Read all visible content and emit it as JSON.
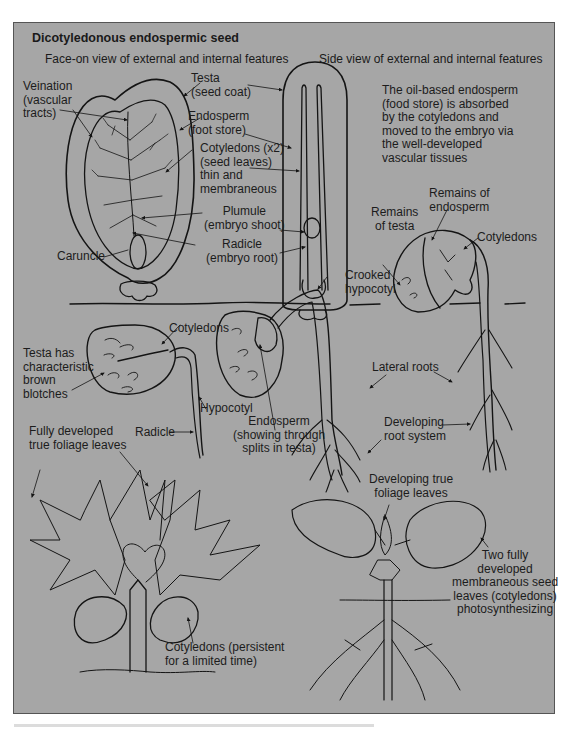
{
  "figure": {
    "title": "Dicotyledonous endospermic seed",
    "background": "#a6a6a6",
    "line_color": "#141414",
    "face_view_heading": "Face-on view of external and internal features",
    "side_view_heading": "Side view of external and internal features"
  },
  "face_view_labels": {
    "veination": "Veination\n(vascular\ntracts)",
    "testa": "Testa\n(seed coat)",
    "endosperm": "Endosperm\n(foot store)",
    "cotyledons": "Cotyledons (x2)\n(seed leaves)\nthin and\nmembraneous",
    "plumule": "Plumule\n(embryo shoot)",
    "radicle": "Radicle\n(embryo root)",
    "caruncle": "Caruncle"
  },
  "side_view_note": "The oil-based endosperm\n(food store) is absorbed\nby the cotyledons and\nmoved to the embryo via\nthe well-developed\nvascular tissues",
  "germination_labels": {
    "remains_of_testa": "Remains\nof testa",
    "remains_of_endosperm": "Remains of\nendosperm",
    "cotyledons_top": "Cotyledons",
    "crooked_hypocotyl": "Crooked\nhypocotyl",
    "cotyledons_left": "Cotyledons",
    "testa_blotches": "Testa has\ncharacteristic\nbrown\nblotches",
    "hypocotyl": "Hypocotyl",
    "radicle": "Radicle",
    "endosperm_splits": "Endosperm\n(showing through\nsplits in testa)",
    "lateral_roots": "Lateral roots",
    "developing_root_system": "Developing\nroot system"
  },
  "mature_labels": {
    "true_foliage_leaves": "Fully developed\ntrue foliage leaves",
    "cotyledons_persistent": "Cotyledons (persistent\nfor a limited time)",
    "developing_true_leaves": "Developing true\nfoliage leaves",
    "two_seed_leaves": "Two fully\ndeveloped\nmembraneous seed\nleaves (cotyledons)\nphotosynthesizing"
  }
}
